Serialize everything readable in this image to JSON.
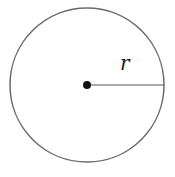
{
  "diagram": {
    "type": "circle-radius",
    "circle": {
      "cx": 87,
      "cy": 85,
      "r": 77,
      "stroke": "#6b6b6b"
    },
    "center_point": {
      "cx": 87,
      "cy": 85,
      "r": 4,
      "fill": "#111111"
    },
    "radius_line": {
      "x1": 87,
      "y1": 85,
      "x2": 164,
      "y2": 85,
      "stroke": "#555555"
    },
    "label": {
      "text": "r",
      "x": 120,
      "y": 70
    }
  }
}
